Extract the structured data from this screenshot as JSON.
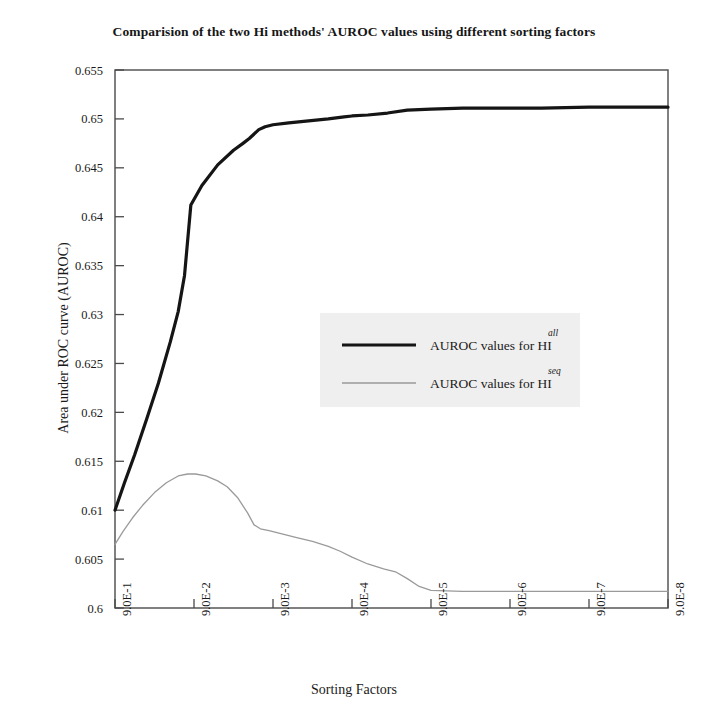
{
  "chart_data": {
    "type": "line",
    "title": "Comparision of the two Hi methods' AUROC values using different sorting factors",
    "xlabel": "Sorting Factors",
    "ylabel": "Area under ROC curve (AUROC)",
    "categories": [
      "9.0E-1",
      "9.0E-2",
      "9.0E-3",
      "9.0E-4",
      "9.0E-5",
      "9.0E-6",
      "9.0E-7",
      "9.0E-8"
    ],
    "x_tick_labels": [
      "9.0E-1",
      "9.0E-2",
      "9.0E-3",
      "9.0E-4",
      "9.0E-5",
      "9.0E-6",
      "9.0E-7",
      "9.0E-8"
    ],
    "y_tick_labels": [
      "0.6",
      "0.605",
      "0.61",
      "0.615",
      "0.62",
      "0.625",
      "0.63",
      "0.635",
      "0.64",
      "0.645",
      "0.65",
      "0.655"
    ],
    "y_tick_values": [
      0.6,
      0.605,
      0.61,
      0.615,
      0.62,
      0.625,
      0.63,
      0.635,
      0.64,
      0.645,
      0.65,
      0.655
    ],
    "ylim": [
      0.6,
      0.655
    ],
    "xlim": [
      1,
      8
    ],
    "grid": false,
    "legend_position": "center",
    "series": [
      {
        "name": "AUROC values for HI",
        "superscript": "all",
        "color": "#151515",
        "linewidth": 3.2,
        "x": [
          1.0,
          1.12,
          1.25,
          1.4,
          1.55,
          1.7,
          1.8,
          1.88,
          1.96,
          2.1,
          2.3,
          2.5,
          2.62,
          2.7,
          2.82,
          2.9,
          3.0,
          3.2,
          3.45,
          3.7,
          3.9,
          4.0,
          4.2,
          4.45,
          4.7,
          5.0,
          5.4,
          5.9,
          6.4,
          7.0,
          7.5,
          8.0
        ],
        "y": [
          0.61,
          0.6128,
          0.6157,
          0.6193,
          0.623,
          0.6272,
          0.6303,
          0.634,
          0.6412,
          0.6432,
          0.6453,
          0.6468,
          0.6475,
          0.648,
          0.6489,
          0.6492,
          0.6494,
          0.6496,
          0.6498,
          0.65,
          0.6502,
          0.6503,
          0.6504,
          0.6506,
          0.6509,
          0.651,
          0.6511,
          0.6511,
          0.6511,
          0.6512,
          0.6512,
          0.6512
        ]
      },
      {
        "name": "AUROC values for HI",
        "superscript": "seq",
        "color": "#9a9a9a",
        "linewidth": 1.3,
        "x": [
          1.0,
          1.1,
          1.22,
          1.35,
          1.5,
          1.65,
          1.8,
          1.92,
          2.02,
          2.15,
          2.3,
          2.42,
          2.55,
          2.68,
          2.76,
          2.84,
          2.95,
          3.1,
          3.3,
          3.5,
          3.7,
          3.85,
          4.0,
          4.2,
          4.4,
          4.55,
          4.7,
          4.85,
          5.0,
          5.4,
          6.0,
          6.6,
          7.2,
          8.0
        ],
        "y": [
          0.6065,
          0.6078,
          0.6092,
          0.6105,
          0.6118,
          0.6128,
          0.6135,
          0.6137,
          0.6137,
          0.6135,
          0.613,
          0.6124,
          0.6113,
          0.6097,
          0.6085,
          0.6081,
          0.6079,
          0.6076,
          0.6072,
          0.6068,
          0.6063,
          0.6058,
          0.6052,
          0.6045,
          0.604,
          0.6037,
          0.603,
          0.6022,
          0.6018,
          0.6017,
          0.6017,
          0.6017,
          0.6017,
          0.6017
        ]
      }
    ],
    "legend": [
      {
        "label": "AUROC values for HI",
        "superscript": "all",
        "color": "#151515",
        "linewidth": 3.2
      },
      {
        "label": "AUROC values for HI",
        "superscript": "seq",
        "color": "#9a9a9a",
        "linewidth": 1.3
      }
    ],
    "colors": {
      "axis": "#4a4a4a",
      "text": "#1a1a1a",
      "series_all": "#151515",
      "series_seq": "#9a9a9a",
      "legend_background": "#efefef",
      "background": "#ffffff"
    }
  }
}
